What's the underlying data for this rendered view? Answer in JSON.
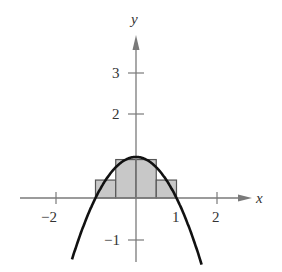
{
  "chart_data": {
    "type": "line",
    "title": "",
    "xlabel": "x",
    "ylabel": "y",
    "xlim": [
      -2.2,
      2.9
    ],
    "ylim": [
      -1.5,
      3.9
    ],
    "grid": false,
    "legend": null,
    "x_ticks": [
      -2,
      1,
      2
    ],
    "x_tick_labels": [
      "−2",
      "1",
      "2"
    ],
    "y_ticks": [
      -1,
      2,
      3
    ],
    "y_tick_labels": [
      "−1",
      "2",
      "3"
    ],
    "series": [
      {
        "name": "f(x) = 1 - x^2",
        "type": "line",
        "x": [
          -1.58,
          -1.5,
          -1.25,
          -1,
          -0.75,
          -0.5,
          -0.25,
          0,
          0.25,
          0.5,
          0.75,
          1,
          1.25,
          1.5,
          1.65
        ],
        "y": [
          -1.5,
          -1.25,
          -0.5625,
          0,
          0.4375,
          0.75,
          0.9375,
          1,
          0.9375,
          0.75,
          0.4375,
          0,
          -0.5625,
          -1.25,
          -1.72
        ]
      }
    ],
    "rectangles": [
      {
        "x0": -1.0,
        "x1": -0.5,
        "height": 0.4375
      },
      {
        "x0": -0.5,
        "x1": 0.0,
        "height": 0.9375
      },
      {
        "x0": 0.0,
        "x1": 0.5,
        "height": 0.9375
      },
      {
        "x0": 0.5,
        "x1": 1.0,
        "height": 0.4375
      }
    ],
    "colors": {
      "curve": "#111111",
      "axis": "#777777",
      "rect_fill": "#c8c8c8",
      "rect_stroke": "#555555"
    }
  },
  "labels": {
    "x_axis": "x",
    "y_axis": "y",
    "tick_neg2": "−2",
    "tick_1": "1",
    "tick_2": "2",
    "tick_y3": "3",
    "tick_y2": "2",
    "tick_yneg1": "−1"
  }
}
